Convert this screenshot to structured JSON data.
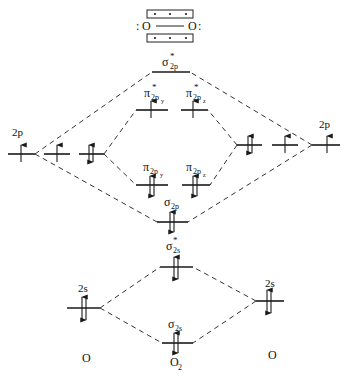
{
  "lewis": {
    "left_atom": "O",
    "right_atom": "O",
    "left_lone_pair": ":",
    "right_lone_pair": ":",
    "top_box_electrons": 3,
    "bottom_box_electrons": 3
  },
  "atoms": {
    "left": {
      "label": "O",
      "orbitals": {
        "2p": {
          "label": "2p",
          "electrons": [
            "up",
            "up",
            "updown"
          ]
        },
        "2s": {
          "label": "2s",
          "electrons": "updown"
        }
      }
    },
    "right": {
      "label": "O",
      "orbitals": {
        "2p": {
          "label": "2p",
          "electrons": [
            "updown",
            "up",
            "up"
          ]
        },
        "2s": {
          "label": "2s",
          "electrons": "updown"
        }
      }
    },
    "molecule": {
      "label": "O",
      "subscript": "2"
    }
  },
  "molecular_orbitals": [
    {
      "id": "sigma_star_2p",
      "symbol": "σ",
      "sub": "2p",
      "star": true,
      "electrons": "none"
    },
    {
      "id": "pi_star_2py",
      "symbol": "π",
      "sub": "2p",
      "subsub": "y",
      "star": true,
      "electrons": "up"
    },
    {
      "id": "pi_star_2pz",
      "symbol": "π",
      "sub": "2p",
      "subsub": "z",
      "star": true,
      "electrons": "up"
    },
    {
      "id": "pi_2py",
      "symbol": "π",
      "sub": "2p",
      "subsub": "y",
      "star": false,
      "electrons": "updown"
    },
    {
      "id": "pi_2pz",
      "symbol": "π",
      "sub": "2p",
      "subsub": "z",
      "star": false,
      "electrons": "updown"
    },
    {
      "id": "sigma_2p",
      "symbol": "σ",
      "sub": "2p",
      "star": false,
      "electrons": "updown"
    },
    {
      "id": "sigma_star_2s",
      "symbol": "σ",
      "sub": "2s",
      "star": true,
      "electrons": "updown"
    },
    {
      "id": "sigma_2s",
      "symbol": "σ",
      "sub": "2s",
      "star": false,
      "electrons": "updown"
    }
  ],
  "labels": {
    "sigma": "σ",
    "pi": "π",
    "sub_2p": "2p",
    "sub_2s": "2s",
    "sub_y": "y",
    "sub_z": "z",
    "star": "*",
    "left_2p": "2p",
    "right_2p": "2p",
    "left_2s": "2s",
    "right_2s": "2s",
    "atom_left": "O",
    "atom_right": "O",
    "molecule": "O",
    "molecule_sub": "2"
  }
}
